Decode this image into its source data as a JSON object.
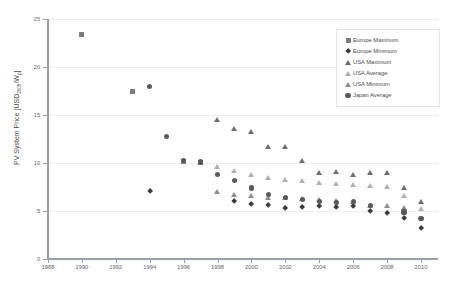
{
  "chart_data": {
    "type": "scatter",
    "title": "",
    "xlabel": "",
    "ylabel": "PV System Price [USD2005/Wp]",
    "ylabel_main": "PV System Price [USD",
    "ylabel_sub": "2005",
    "ylabel_tail": "/W",
    "ylabel_sub2": "p",
    "ylabel_end": "]",
    "xlim": [
      1988,
      2011
    ],
    "ylim": [
      0,
      25
    ],
    "xticks": [
      1988,
      1990,
      1992,
      1994,
      1996,
      1998,
      2000,
      2002,
      2004,
      2006,
      2008,
      2010
    ],
    "yticks": [
      0,
      5,
      10,
      15,
      20,
      25
    ],
    "grid": "horizontal",
    "legend_position": "top-right",
    "series": [
      {
        "name": "Europe Maximum",
        "marker": "square",
        "color": "#7d7d7d",
        "points": [
          {
            "x": 1990,
            "y": 23.4
          },
          {
            "x": 1993,
            "y": 17.4
          },
          {
            "x": 1996,
            "y": 10.2
          },
          {
            "x": 1997,
            "y": 10.1
          }
        ]
      },
      {
        "name": "Europe Minimum",
        "marker": "diamond",
        "color": "#3a3a3a",
        "points": [
          {
            "x": 1994,
            "y": 7.1
          },
          {
            "x": 1999,
            "y": 6.0
          },
          {
            "x": 2000,
            "y": 5.7
          },
          {
            "x": 2001,
            "y": 5.6
          },
          {
            "x": 2002,
            "y": 5.3
          },
          {
            "x": 2003,
            "y": 5.4
          },
          {
            "x": 2004,
            "y": 5.5
          },
          {
            "x": 2005,
            "y": 5.4
          },
          {
            "x": 2006,
            "y": 5.5
          },
          {
            "x": 2007,
            "y": 5.0
          },
          {
            "x": 2008,
            "y": 4.8
          },
          {
            "x": 2009,
            "y": 4.3
          },
          {
            "x": 2010,
            "y": 3.2
          }
        ]
      },
      {
        "name": "USA Maximum",
        "marker": "triangle",
        "color": "#6e6e6e",
        "points": [
          {
            "x": 1998,
            "y": 14.5
          },
          {
            "x": 1999,
            "y": 13.6
          },
          {
            "x": 2000,
            "y": 13.2
          },
          {
            "x": 2001,
            "y": 11.7
          },
          {
            "x": 2002,
            "y": 11.7
          },
          {
            "x": 2003,
            "y": 10.2
          },
          {
            "x": 2004,
            "y": 9.0
          },
          {
            "x": 2005,
            "y": 9.1
          },
          {
            "x": 2006,
            "y": 8.8
          },
          {
            "x": 2007,
            "y": 9.0
          },
          {
            "x": 2008,
            "y": 9.0
          },
          {
            "x": 2009,
            "y": 7.4
          },
          {
            "x": 2010,
            "y": 5.9
          }
        ]
      },
      {
        "name": "USA Average",
        "marker": "triangle",
        "color": "#b0b0b0",
        "points": [
          {
            "x": 1998,
            "y": 9.6
          },
          {
            "x": 1999,
            "y": 9.2
          },
          {
            "x": 2000,
            "y": 8.8
          },
          {
            "x": 2001,
            "y": 8.4
          },
          {
            "x": 2002,
            "y": 8.2
          },
          {
            "x": 2003,
            "y": 8.1
          },
          {
            "x": 2004,
            "y": 7.9
          },
          {
            "x": 2005,
            "y": 7.8
          },
          {
            "x": 2006,
            "y": 7.7
          },
          {
            "x": 2007,
            "y": 7.6
          },
          {
            "x": 2008,
            "y": 7.5
          },
          {
            "x": 2009,
            "y": 6.6
          },
          {
            "x": 2010,
            "y": 5.2
          }
        ]
      },
      {
        "name": "USA Minimum",
        "marker": "triangle",
        "color": "#8c8c8c",
        "points": [
          {
            "x": 1998,
            "y": 7.0
          },
          {
            "x": 1999,
            "y": 6.7
          },
          {
            "x": 2000,
            "y": 6.6
          },
          {
            "x": 2001,
            "y": 6.4
          },
          {
            "x": 2002,
            "y": 6.4
          },
          {
            "x": 2003,
            "y": 6.3
          },
          {
            "x": 2004,
            "y": 6.2
          },
          {
            "x": 2005,
            "y": 6.1
          },
          {
            "x": 2006,
            "y": 5.9
          },
          {
            "x": 2007,
            "y": 5.5
          },
          {
            "x": 2008,
            "y": 5.5
          },
          {
            "x": 2009,
            "y": 5.3
          }
        ]
      },
      {
        "name": "Japan Average",
        "marker": "circle",
        "color": "#5a5a5a",
        "points": [
          {
            "x": 1994,
            "y": 18.0
          },
          {
            "x": 1995,
            "y": 12.8
          },
          {
            "x": 1996,
            "y": 10.3
          },
          {
            "x": 1997,
            "y": 10.1
          },
          {
            "x": 1998,
            "y": 8.8
          },
          {
            "x": 1999,
            "y": 8.2
          },
          {
            "x": 2000,
            "y": 7.4
          },
          {
            "x": 2001,
            "y": 6.7
          },
          {
            "x": 2002,
            "y": 6.4
          },
          {
            "x": 2003,
            "y": 6.2
          },
          {
            "x": 2004,
            "y": 6.0
          },
          {
            "x": 2005,
            "y": 5.9
          },
          {
            "x": 2006,
            "y": 6.0
          },
          {
            "x": 2007,
            "y": 5.6
          },
          {
            "x": 2009,
            "y": 4.9
          },
          {
            "x": 2010,
            "y": 4.2
          }
        ]
      }
    ]
  },
  "legend": {
    "items": [
      {
        "label": "Europe Maximum",
        "marker": "square",
        "color": "#7d7d7d"
      },
      {
        "label": "Europe Minimum",
        "marker": "diamond",
        "color": "#3a3a3a"
      },
      {
        "label": "USA Maximum",
        "marker": "triangle",
        "color": "#6e6e6e"
      },
      {
        "label": "USA Average",
        "marker": "triangle",
        "color": "#b0b0b0"
      },
      {
        "label": "USA Minimum",
        "marker": "triangle",
        "color": "#8c8c8c"
      },
      {
        "label": "Japan Average",
        "marker": "circle",
        "color": "#5a5a5a"
      }
    ]
  },
  "style": {
    "background": "#ffffff",
    "gridline_color": "#eceff1",
    "axis_color": "#9aa0a6",
    "tick_text_color": "#5f6368"
  }
}
